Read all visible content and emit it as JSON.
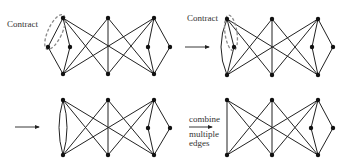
{
  "figure": {
    "panels": [
      {
        "id": "p1",
        "label": "Contract",
        "nodes": {
          "TL": [
            63,
            18
          ],
          "TC": [
            108,
            18
          ],
          "TR": [
            154,
            18
          ],
          "ML1": [
            48,
            47
          ],
          "ML2": [
            70,
            47
          ],
          "MR1": [
            148,
            47
          ],
          "MR2": [
            170,
            47
          ],
          "BL": [
            63,
            74
          ],
          "BC": [
            108,
            74
          ],
          "BR": [
            154,
            74
          ]
        },
        "edges": [
          [
            "TL",
            "ML1"
          ],
          [
            "TL",
            "ML2"
          ],
          [
            "ML1",
            "BL"
          ],
          [
            "ML2",
            "BL"
          ],
          [
            "TL",
            "BC"
          ],
          [
            "TL",
            "BR"
          ],
          [
            "TC",
            "BL"
          ],
          [
            "TC",
            "BC"
          ],
          [
            "TC",
            "BR"
          ],
          [
            "TR",
            "BL"
          ],
          [
            "TR",
            "BC"
          ],
          [
            "TR",
            "MR1"
          ],
          [
            "TR",
            "MR2"
          ],
          [
            "MR1",
            "BR"
          ],
          [
            "MR2",
            "BR"
          ]
        ],
        "curved_edges": [],
        "ellipse": {
          "cx": 55,
          "cy": 32,
          "rx": 7,
          "ry": 19,
          "rot": 25
        }
      },
      {
        "id": "p2",
        "label": "Contract",
        "nodes": {
          "TL": [
            227,
            19
          ],
          "TC": [
            272,
            19
          ],
          "TR": [
            318,
            19
          ],
          "ML2": [
            234,
            47
          ],
          "MR1": [
            312,
            47
          ],
          "MR2": [
            333,
            47
          ],
          "BL": [
            227,
            75
          ],
          "BC": [
            272,
            75
          ],
          "BR": [
            318,
            75
          ]
        },
        "edges": [
          [
            "TL",
            "ML2"
          ],
          [
            "ML2",
            "BL"
          ],
          [
            "TL",
            "BC"
          ],
          [
            "TL",
            "BR"
          ],
          [
            "TC",
            "BL"
          ],
          [
            "TC",
            "BC"
          ],
          [
            "TC",
            "BR"
          ],
          [
            "TR",
            "BL"
          ],
          [
            "TR",
            "BC"
          ],
          [
            "TR",
            "MR1"
          ],
          [
            "TR",
            "MR2"
          ],
          [
            "MR1",
            "BR"
          ],
          [
            "MR2",
            "BR"
          ]
        ],
        "curved_edges": [
          [
            "TL",
            "BL",
            -12
          ]
        ],
        "ellipse": {
          "cx": 231,
          "cy": 33,
          "rx": 6,
          "ry": 18,
          "rot": -8
        }
      },
      {
        "id": "p3",
        "label": "",
        "nodes": {
          "TL": [
            63,
            100
          ],
          "TC": [
            108,
            100
          ],
          "TR": [
            154,
            100
          ],
          "MR1": [
            148,
            128
          ],
          "MR2": [
            170,
            128
          ],
          "BL": [
            63,
            155
          ],
          "BC": [
            108,
            155
          ],
          "BR": [
            154,
            155
          ]
        },
        "edges": [
          [
            "TL",
            "BC"
          ],
          [
            "TL",
            "BR"
          ],
          [
            "TC",
            "BL"
          ],
          [
            "TC",
            "BC"
          ],
          [
            "TC",
            "BR"
          ],
          [
            "TR",
            "BL"
          ],
          [
            "TR",
            "BC"
          ],
          [
            "TR",
            "MR1"
          ],
          [
            "TR",
            "MR2"
          ],
          [
            "MR1",
            "BR"
          ],
          [
            "MR2",
            "BR"
          ]
        ],
        "curved_edges": [
          [
            "TL",
            "BL",
            -8
          ],
          [
            "TL",
            "BL",
            8
          ]
        ],
        "ellipse": null
      },
      {
        "id": "p4",
        "label": "",
        "nodes": {
          "TL": [
            227,
            100
          ],
          "TC": [
            272,
            100
          ],
          "TR": [
            318,
            100
          ],
          "MR1": [
            311,
            128
          ],
          "MR2": [
            333,
            128
          ],
          "BL": [
            227,
            155
          ],
          "BC": [
            272,
            155
          ],
          "BR": [
            318,
            155
          ]
        },
        "edges": [
          [
            "TL",
            "BL"
          ],
          [
            "TL",
            "BC"
          ],
          [
            "TL",
            "BR"
          ],
          [
            "TC",
            "BL"
          ],
          [
            "TC",
            "BC"
          ],
          [
            "TC",
            "BR"
          ],
          [
            "TR",
            "BL"
          ],
          [
            "TR",
            "BC"
          ],
          [
            "TR",
            "MR1"
          ],
          [
            "TR",
            "MR2"
          ],
          [
            "MR1",
            "BR"
          ],
          [
            "MR2",
            "BR"
          ]
        ],
        "curved_edges": [],
        "ellipse": null
      }
    ],
    "arrows": [
      {
        "x1": 185,
        "y1": 47,
        "x2": 209,
        "y2": 47
      },
      {
        "x1": 15,
        "y1": 127,
        "x2": 39,
        "y2": 127
      },
      {
        "x1": 189,
        "y1": 127,
        "x2": 212,
        "y2": 127
      }
    ],
    "labels": {
      "contract_1": "Contract",
      "contract_2": "Contract",
      "combine_top": "combine",
      "combine_bottom_1": "multiple",
      "combine_bottom_2": "edges"
    }
  }
}
